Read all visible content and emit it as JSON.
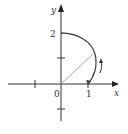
{
  "diagram": {
    "type": "polar-curve",
    "axes": {
      "x_label": "x",
      "y_label": "y",
      "origin_label": "0",
      "x_tick_labels": [
        "1"
      ],
      "y_tick_labels": [
        "2"
      ]
    },
    "curve": {
      "description": "polar curve from (1,0) to (0,2), arc in first quadrant",
      "start": [
        1,
        0
      ],
      "end": [
        0,
        2
      ]
    },
    "radius_segment": "line from origin to curve",
    "direction_arrow": "counterclockwise (upward)",
    "colors": {
      "axis": "#333333",
      "curve": "#444444",
      "radius": "#aaaaaa"
    }
  }
}
